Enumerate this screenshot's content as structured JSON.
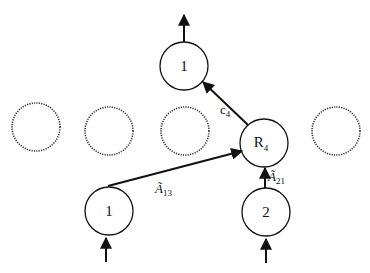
{
  "diagram": {
    "nodes": {
      "output_node": {
        "label": "1"
      },
      "router_node": {
        "label": "R",
        "subscript": "4"
      },
      "input_node_1": {
        "label": "1"
      },
      "input_node_2": {
        "label": "2"
      },
      "placeholder_count": 4
    },
    "edges": {
      "c4": {
        "label": "c",
        "subscript": "4"
      },
      "a13": {
        "label": "Ã",
        "subscript": "13"
      },
      "a21": {
        "label": "Ã",
        "subscript": "21"
      }
    },
    "colors": {
      "stroke": "#111111",
      "background": "#ffffff"
    }
  }
}
